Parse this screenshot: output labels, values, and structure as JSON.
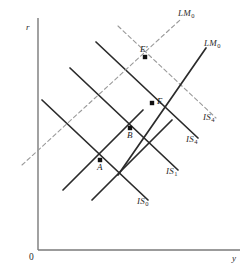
{
  "chart_data": {
    "type": "line",
    "title": "",
    "xlabel": "y",
    "ylabel": "r",
    "origin_label": "0",
    "grid": false,
    "legend": "inline-curve-labels",
    "axes": {
      "x": {
        "label": "y",
        "from": [
          38,
          250
        ],
        "to": [
          240,
          250
        ]
      },
      "y": {
        "label": "r",
        "from": [
          38,
          18
        ],
        "to": [
          38,
          250
        ]
      }
    },
    "curves": [
      {
        "name": "IS0",
        "label": "IS",
        "subscript": "0",
        "style": "solid",
        "slope": "negative",
        "x1": 42,
        "y1": 100,
        "x2": 148,
        "y2": 200,
        "label_x": 137,
        "label_y": 196
      },
      {
        "name": "IS1",
        "label": "IS",
        "subscript": "1",
        "style": "solid",
        "slope": "negative",
        "x1": 70,
        "y1": 68,
        "x2": 178,
        "y2": 170,
        "label_x": 166,
        "label_y": 166
      },
      {
        "name": "IS4",
        "label": "IS",
        "subscript": "4",
        "style": "solid",
        "slope": "negative",
        "x1": 96,
        "y1": 42,
        "x2": 198,
        "y2": 138,
        "label_x": 186,
        "label_y": 134
      },
      {
        "name": "IS4-dashed",
        "label": "IS",
        "subscript": "4",
        "style": "dashed",
        "slope": "negative",
        "x1": 118,
        "y1": 26,
        "x2": 216,
        "y2": 118,
        "label_x": 203,
        "label_y": 112
      },
      {
        "name": "LM-lower",
        "label": "",
        "subscript": "",
        "style": "solid",
        "slope": "positive",
        "x1": 63,
        "y1": 190,
        "x2": 143,
        "y2": 110
      },
      {
        "name": "LM-mid",
        "label": "",
        "subscript": "",
        "style": "solid",
        "slope": "positive",
        "x1": 92,
        "y1": 200,
        "x2": 172,
        "y2": 120
      },
      {
        "name": "LM0-solid",
        "label": "LM",
        "subscript": "0",
        "style": "solid",
        "slope": "positive",
        "x1": 118,
        "y1": 175,
        "x2": 206,
        "y2": 48,
        "label_x": 204,
        "label_y": 38
      },
      {
        "name": "LM0-dashed",
        "label": "LM",
        "subscript": "0",
        "style": "dashed",
        "slope": "positive",
        "x1": 22,
        "y1": 165,
        "x2": 180,
        "y2": 20,
        "label_x": 178,
        "label_y": 8
      }
    ],
    "points": [
      {
        "name": "A",
        "label": "A",
        "x": 100,
        "y": 160,
        "label_x": 97,
        "label_y": 162
      },
      {
        "name": "B",
        "label": "B",
        "x": 130,
        "y": 128,
        "label_x": 127,
        "label_y": 130
      },
      {
        "name": "E",
        "label": "E",
        "x": 152,
        "y": 103,
        "label_x": 157,
        "label_y": 96
      },
      {
        "name": "Eprime",
        "label": "E′",
        "x": 145,
        "y": 57,
        "label_x": 140,
        "label_y": 44
      }
    ],
    "colors": {
      "axis": "#7a7a7a",
      "solid_curve": "#2b2b2b",
      "dashed_curve": "#9a9a9a",
      "point": "#111111",
      "text": "#2b2b2b",
      "background": "#ffffff"
    }
  }
}
